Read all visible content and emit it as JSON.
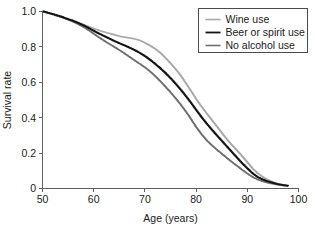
{
  "chart_data": {
    "type": "line",
    "title": "",
    "subtitle": "",
    "xlabel": "Age (years)",
    "ylabel": "Survival rate",
    "xlim": [
      50,
      100
    ],
    "ylim": [
      0,
      1.0
    ],
    "xticks": [
      50,
      60,
      70,
      80,
      90,
      100
    ],
    "xtick_labels": [
      "50",
      "60",
      "70",
      "80",
      "90",
      "100"
    ],
    "yticks": [
      0,
      0.2,
      0.4,
      0.6,
      0.8,
      1.0
    ],
    "ytick_labels": [
      "0",
      "0.2",
      "0.4",
      "0.6",
      "0.8",
      "1.0"
    ],
    "grid": false,
    "legend_position": "top-right",
    "x": [
      50,
      52,
      54,
      55,
      56,
      57,
      58,
      59,
      60,
      61,
      62,
      63,
      64,
      65,
      66,
      67,
      68,
      69,
      70,
      71,
      72,
      73,
      74,
      75,
      76,
      77,
      78,
      79,
      80,
      81,
      82,
      83,
      84,
      85,
      86,
      87,
      88,
      89,
      90,
      91,
      92,
      93,
      94,
      95,
      96,
      97,
      98
    ],
    "series": [
      {
        "name": "Wine use",
        "color": "#a8a8a8",
        "width": 1.6,
        "values": [
          1.0,
          0.985,
          0.968,
          0.958,
          0.948,
          0.937,
          0.925,
          0.914,
          0.903,
          0.893,
          0.884,
          0.876,
          0.868,
          0.86,
          0.855,
          0.85,
          0.845,
          0.836,
          0.822,
          0.806,
          0.788,
          0.765,
          0.736,
          0.705,
          0.672,
          0.635,
          0.592,
          0.548,
          0.503,
          0.462,
          0.424,
          0.387,
          0.35,
          0.313,
          0.276,
          0.243,
          0.212,
          0.18,
          0.146,
          0.112,
          0.085,
          0.064,
          0.048,
          0.036,
          0.027,
          0.02,
          0.016
        ]
      },
      {
        "name": "Beer or spirit use",
        "color": "#141414",
        "width": 1.8,
        "values": [
          1.0,
          0.984,
          0.966,
          0.956,
          0.946,
          0.934,
          0.921,
          0.906,
          0.89,
          0.875,
          0.861,
          0.847,
          0.833,
          0.82,
          0.808,
          0.795,
          0.781,
          0.765,
          0.747,
          0.726,
          0.703,
          0.678,
          0.651,
          0.622,
          0.59,
          0.556,
          0.52,
          0.482,
          0.442,
          0.403,
          0.367,
          0.333,
          0.3,
          0.268,
          0.236,
          0.204,
          0.172,
          0.141,
          0.112,
          0.085,
          0.064,
          0.05,
          0.04,
          0.031,
          0.024,
          0.019,
          0.015
        ]
      },
      {
        "name": "No alcohol use",
        "color": "#6e6e6e",
        "width": 1.6,
        "values": [
          1.0,
          0.983,
          0.964,
          0.953,
          0.941,
          0.927,
          0.911,
          0.893,
          0.873,
          0.853,
          0.834,
          0.816,
          0.799,
          0.781,
          0.762,
          0.742,
          0.722,
          0.703,
          0.683,
          0.66,
          0.633,
          0.604,
          0.573,
          0.541,
          0.507,
          0.471,
          0.432,
          0.389,
          0.345,
          0.306,
          0.272,
          0.244,
          0.219,
          0.195,
          0.171,
          0.148,
          0.126,
          0.104,
          0.083,
          0.064,
          0.05,
          0.04,
          0.032,
          0.026,
          0.021,
          0.017,
          0.014
        ]
      }
    ],
    "legend_entries": [
      {
        "label": "Wine use",
        "color": "#a8a8a8",
        "width": 1.6
      },
      {
        "label": "Beer or spirit use",
        "color": "#141414",
        "width": 1.8
      },
      {
        "label": "No alcohol use",
        "color": "#6e6e6e",
        "width": 1.6
      }
    ]
  }
}
